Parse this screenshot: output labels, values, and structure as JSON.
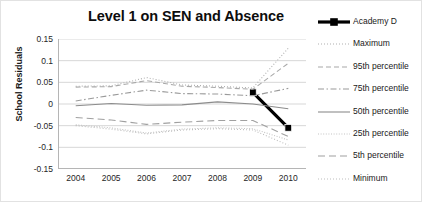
{
  "chart_data": {
    "type": "line",
    "title": "Level 1 on SEN and Absence",
    "xlabel": "",
    "ylabel": "School Residuals",
    "categories": [
      "2004",
      "2005",
      "2006",
      "2007",
      "2008",
      "2009",
      "2010"
    ],
    "ylim": [
      -0.15,
      0.15
    ],
    "yticks": [
      "0.15",
      "0.1",
      "0.05",
      "0",
      "-0.05",
      "-0.1",
      "-0.15"
    ],
    "ytick_values": [
      0.15,
      0.1,
      0.05,
      0,
      -0.05,
      -0.1,
      -0.15
    ],
    "grid": true,
    "legend_position": "right",
    "series": [
      {
        "name": "Academy D",
        "color": "#000000",
        "style": "solid-thick-marker",
        "values": [
          null,
          null,
          null,
          null,
          null,
          0.027,
          -0.055
        ]
      },
      {
        "name": "Maximum",
        "color": "#b0b0b0",
        "style": "dotted",
        "values": [
          0.041,
          0.042,
          0.061,
          0.044,
          0.041,
          0.037,
          0.129
        ]
      },
      {
        "name": "95th percentile",
        "color": "#a8a8a8",
        "style": "dashed",
        "values": [
          0.039,
          0.04,
          0.054,
          0.041,
          0.038,
          0.034,
          0.094
        ]
      },
      {
        "name": "75th percentile",
        "color": "#9a9a9a",
        "style": "dash-dot",
        "values": [
          0.007,
          0.02,
          0.032,
          0.024,
          0.023,
          0.019,
          0.036
        ]
      },
      {
        "name": "50th percentile",
        "color": "#8c8c8c",
        "style": "solid",
        "values": [
          -0.004,
          0.001,
          -0.003,
          -0.002,
          0.005,
          0.0,
          -0.011
        ]
      },
      {
        "name": "25th  percentile",
        "color": "#c4c4c4",
        "style": "dotted-fine",
        "values": [
          -0.048,
          -0.055,
          -0.067,
          -0.058,
          -0.055,
          -0.057,
          -0.083
        ]
      },
      {
        "name": "5th percentile",
        "color": "#a0a0a0",
        "style": "dashed-long",
        "values": [
          -0.031,
          -0.037,
          -0.047,
          -0.042,
          -0.038,
          -0.038,
          -0.075
        ]
      },
      {
        "name": "Minimum",
        "color": "#bdbdbd",
        "style": "dotted",
        "values": [
          -0.05,
          -0.058,
          -0.069,
          -0.06,
          -0.057,
          -0.06,
          -0.095
        ]
      }
    ]
  }
}
